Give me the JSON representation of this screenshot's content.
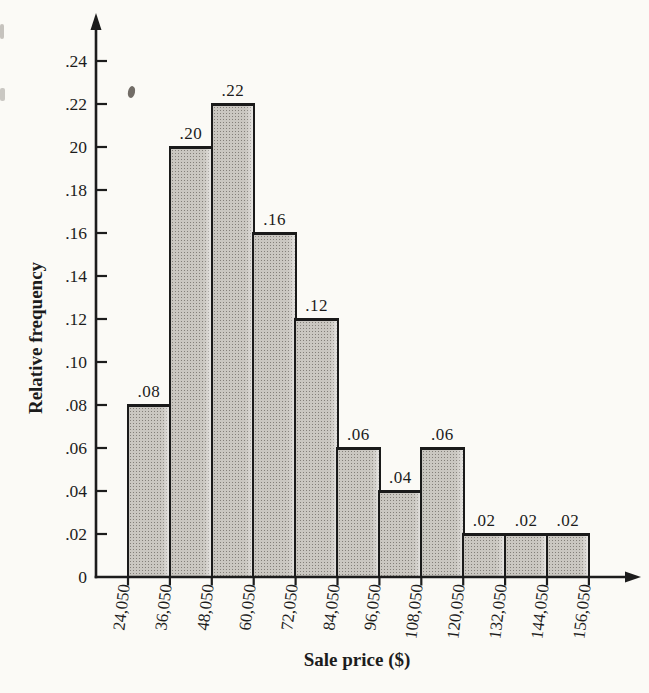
{
  "figure": {
    "y_axis_title": "Relative frequency",
    "x_axis_title": "Sale price ($)"
  },
  "colors": {
    "ink": "#1c1c1c",
    "paper": "#fbfaf6",
    "bar_fill": "#cac7c1",
    "bar_border": "#1a1a1a"
  },
  "chart_data": {
    "type": "bar",
    "chart_kind": "histogram",
    "title": "",
    "xlabel": "Sale price ($)",
    "ylabel": "Relative frequency",
    "bin_edge_labels": [
      "24,050",
      "36,050",
      "48,050",
      "60,050",
      "72,050",
      "84,050",
      "96,050",
      "108,050",
      "120,050",
      "132,050",
      "144,050",
      "156,050"
    ],
    "values": [
      0.08,
      0.2,
      0.22,
      0.16,
      0.12,
      0.06,
      0.04,
      0.06,
      0.02,
      0.02,
      0.02
    ],
    "bar_value_labels": [
      ".08",
      ".20",
      ".22",
      ".16",
      ".12",
      ".06",
      ".04",
      ".06",
      ".02",
      ".02",
      ".02"
    ],
    "y_ticks": [
      {
        "label": "0",
        "value": 0
      },
      {
        "label": ".02",
        "value": 0.02
      },
      {
        "label": ".04",
        "value": 0.04
      },
      {
        "label": ".06",
        "value": 0.06
      },
      {
        "label": ".08",
        "value": 0.08
      },
      {
        "label": ".10",
        "value": 0.1
      },
      {
        "label": ".12",
        "value": 0.12
      },
      {
        "label": ".14",
        "value": 0.14
      },
      {
        "label": ".16",
        "value": 0.16
      },
      {
        "label": ".18",
        "value": 0.18
      },
      {
        "label": "20",
        "value": 0.2
      },
      {
        "label": ".22",
        "value": 0.22
      },
      {
        "label": ".24",
        "value": 0.24
      }
    ],
    "ylim": [
      0,
      0.26
    ],
    "grid": false,
    "legend": null,
    "axis_arrows": [
      "up",
      "right"
    ]
  }
}
